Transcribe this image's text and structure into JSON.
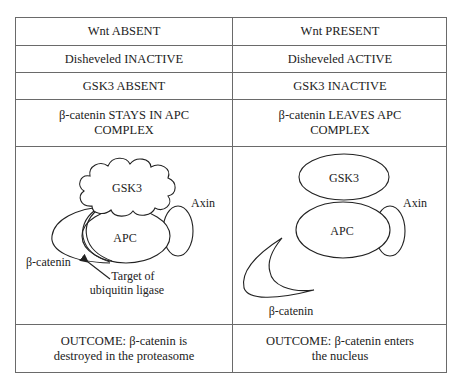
{
  "columns": [
    {
      "header": "Wnt ABSENT",
      "disheveled": "Disheveled INACTIVE",
      "gsk3": "GSK3 ABSENT",
      "beta_catenin_line1": "β-catenin STAYS IN APC",
      "beta_catenin_line2": "COMPLEX",
      "diagram": {
        "gsk3_label": "GSK3",
        "apc_label": "APC",
        "axin_label": "Axin",
        "beta_catenin_label": "β-catenin",
        "target_line1": "Target of",
        "target_line2": "ubiquitin ligase"
      },
      "outcome_line1": "OUTCOME: β-catenin is",
      "outcome_line2": "destroyed in the proteasome"
    },
    {
      "header": "Wnt PRESENT",
      "disheveled": "Disheveled ACTIVE",
      "gsk3": "GSK3 INACTIVE",
      "beta_catenin_line1": "β-catenin LEAVES APC",
      "beta_catenin_line2": "COMPLEX",
      "diagram": {
        "gsk3_label": "GSK3",
        "apc_label": "APC",
        "axin_label": "Axin",
        "beta_catenin_label": "β-catenin"
      },
      "outcome_line1": "OUTCOME: β-catenin enters",
      "outcome_line2": "the nucleus"
    }
  ]
}
